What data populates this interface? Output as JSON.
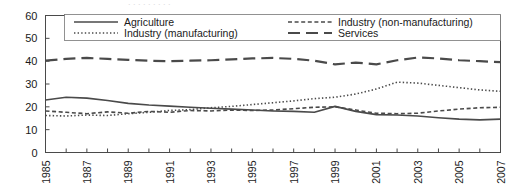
{
  "chart_data": {
    "type": "line",
    "title": "",
    "xlabel": "",
    "ylabel": "",
    "ylim": [
      0,
      60
    ],
    "xlim": [
      1985,
      2007
    ],
    "yticks": [
      0,
      10,
      20,
      30,
      40,
      50,
      60
    ],
    "ytick_labels": [
      "0",
      "10",
      "20",
      "30",
      "40",
      "50",
      "60"
    ],
    "x": [
      1985,
      1986,
      1987,
      1988,
      1989,
      1990,
      1991,
      1992,
      1993,
      1994,
      1995,
      1996,
      1997,
      1998,
      1999,
      2000,
      2001,
      2002,
      2003,
      2004,
      2005,
      2006,
      2007
    ],
    "xtick_labels": [
      "1985",
      "1987",
      "1989",
      "1991",
      "1993",
      "1995",
      "1997",
      "1999",
      "2001",
      "2003",
      "2005",
      "2007"
    ],
    "xtick_values": [
      1985,
      1987,
      1989,
      1991,
      1993,
      1995,
      1997,
      1999,
      2001,
      2003,
      2005,
      2007
    ],
    "grid": false,
    "legend_position": "top",
    "series": [
      {
        "name": "Agriculture",
        "style": "solid",
        "color": "#4a4a4a",
        "values": [
          23.0,
          24.2,
          23.8,
          22.8,
          21.5,
          20.8,
          20.3,
          19.8,
          19.4,
          19.0,
          18.6,
          18.2,
          18.0,
          17.6,
          20.2,
          18.0,
          16.6,
          16.4,
          16.0,
          15.2,
          14.6,
          14.3,
          14.6
        ]
      },
      {
        "name": "Industry (manufacturing)",
        "style": "dotted",
        "color": "#4a4a4a",
        "values": [
          16.2,
          16.0,
          16.4,
          16.2,
          17.0,
          17.6,
          18.4,
          18.8,
          19.6,
          20.2,
          21.0,
          21.8,
          22.6,
          23.6,
          24.2,
          25.6,
          27.8,
          30.8,
          30.4,
          29.4,
          28.4,
          27.4,
          26.8
        ]
      },
      {
        "name": "Industry (non-manufacturing)",
        "style": "dashed",
        "color": "#4a4a4a",
        "values": [
          18.2,
          17.6,
          17.0,
          17.8,
          17.2,
          18.0,
          17.6,
          18.4,
          18.2,
          18.6,
          18.4,
          18.6,
          19.2,
          19.8,
          20.0,
          18.6,
          17.2,
          17.0,
          17.2,
          18.2,
          19.0,
          19.6,
          19.8
        ]
      },
      {
        "name": "Services",
        "style": "longdash",
        "color": "#4a4a4a",
        "values": [
          40.2,
          41.0,
          41.4,
          41.0,
          40.6,
          40.2,
          40.0,
          40.2,
          40.4,
          40.8,
          41.2,
          41.4,
          41.0,
          40.2,
          38.6,
          39.4,
          38.6,
          40.4,
          41.6,
          41.2,
          40.4,
          40.0,
          39.6
        ]
      }
    ]
  },
  "legend": {
    "entries": [
      {
        "label": "Agriculture",
        "style": "solid"
      },
      {
        "label": "Industry (manufacturing)",
        "style": "dotted"
      },
      {
        "label": "Industry (non-manufacturing)",
        "style": "dashed"
      },
      {
        "label": "Services",
        "style": "longdash"
      }
    ]
  }
}
